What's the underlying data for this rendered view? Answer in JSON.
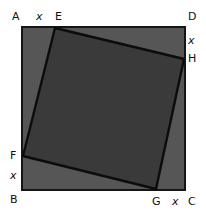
{
  "figure": {
    "kind": "geometry-diagram",
    "canvas": {
      "width": 206,
      "height": 219
    },
    "background_color": "#ffffff",
    "outer_square": {
      "name": "ABCD",
      "fill_color": "#565656",
      "stroke_color": "#151515",
      "stroke_width": 1.5,
      "points": "22,27 185,27 185,190 22,190",
      "corners": {
        "A": {
          "x": 22,
          "y": 27
        },
        "D": {
          "x": 185,
          "y": 27
        },
        "C": {
          "x": 185,
          "y": 190
        },
        "B": {
          "x": 22,
          "y": 190
        }
      }
    },
    "inner_square": {
      "name": "EFGH",
      "fill_color": "#3a3a3a",
      "stroke_color": "#0c0c0c",
      "stroke_width": 2.4,
      "points": "55,28 184,59 156,189 23,156",
      "corners": {
        "E": {
          "x": 55,
          "y": 28
        },
        "H": {
          "x": 184,
          "y": 59
        },
        "G": {
          "x": 156,
          "y": 189
        },
        "F": {
          "x": 23,
          "y": 156
        }
      }
    },
    "vertex_labels": {
      "A": "A",
      "B": "B",
      "C": "C",
      "D": "D",
      "E": "E",
      "F": "F",
      "G": "G",
      "H": "H"
    },
    "length_labels": {
      "top": "x",
      "right": "x",
      "left": "x",
      "bottom": "x"
    }
  }
}
